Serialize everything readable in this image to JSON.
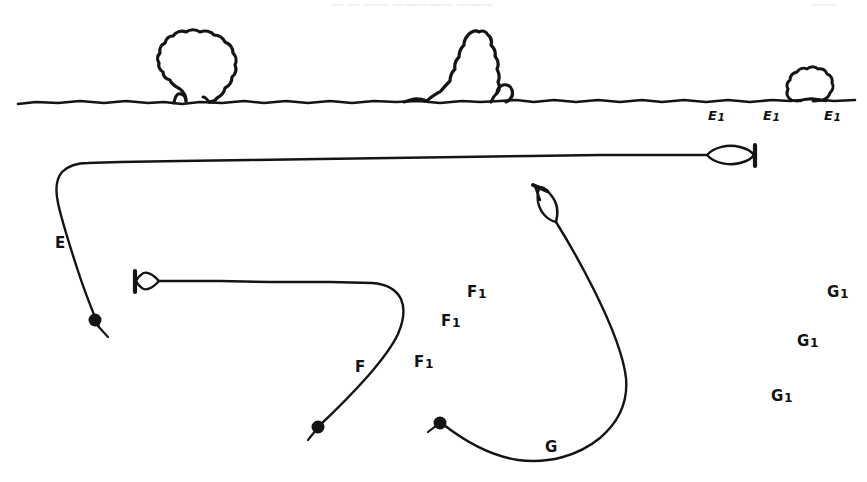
{
  "figure": {
    "background_color": "#ffffff",
    "ink_color": "#141414",
    "width": 867,
    "height": 482
  },
  "top_fragments": [
    {
      "text": "— — ——  —————  ———",
      "x": 332,
      "y": 0
    },
    {
      "text": "——",
      "x": 812,
      "y": 0
    }
  ],
  "scene": {
    "ground_line_name": "ground-line",
    "trees": [
      {
        "name": "tree-large-round",
        "x": 158,
        "y": 32
      },
      {
        "name": "tree-large-jagged",
        "x": 425,
        "y": 30
      },
      {
        "name": "bush-small",
        "x": 785,
        "y": 60
      }
    ]
  },
  "ground_labels": [
    {
      "base": "E",
      "sub": "1",
      "x": 708,
      "y": 109
    },
    {
      "base": "E",
      "sub": "1",
      "x": 763,
      "y": 109
    },
    {
      "base": "E",
      "sub": "1",
      "x": 824,
      "y": 109
    }
  ],
  "curves": [
    {
      "name": "curve-e",
      "label": "E",
      "label_x": 55,
      "label_y": 236,
      "start_dot": {
        "x": 95,
        "y": 321
      },
      "arrowhead": {
        "x": 755,
        "y": 155,
        "angle": 0
      }
    },
    {
      "name": "curve-f",
      "label": "F",
      "label_x": 355,
      "label_y": 360,
      "start_dot": {
        "x": 318,
        "y": 427
      },
      "arrowhead": {
        "x": 137,
        "y": 281,
        "angle": 180
      }
    },
    {
      "name": "curve-g",
      "label": "G",
      "label_x": 545,
      "label_y": 440,
      "start_dot": {
        "x": 440,
        "y": 423
      },
      "arrowhead": {
        "x": 543,
        "y": 205,
        "angle": -75
      }
    }
  ],
  "field_labels": [
    {
      "base": "F",
      "sub": "1",
      "x": 467,
      "y": 285
    },
    {
      "base": "F",
      "sub": "1",
      "x": 441,
      "y": 314
    },
    {
      "base": "F",
      "sub": "1",
      "x": 414,
      "y": 355
    },
    {
      "base": "G",
      "sub": "1",
      "x": 827,
      "y": 285
    },
    {
      "base": "G",
      "sub": "1",
      "x": 797,
      "y": 334
    },
    {
      "base": "G",
      "sub": "1",
      "x": 771,
      "y": 389
    }
  ]
}
